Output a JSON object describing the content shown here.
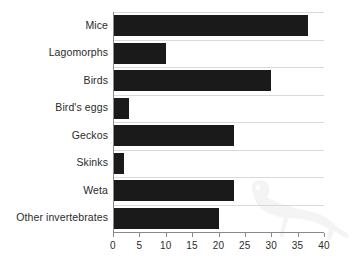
{
  "chart_data": {
    "type": "bar",
    "orientation": "horizontal",
    "title": "",
    "subtitle": "",
    "xlabel": "",
    "ylabel": "",
    "categories": [
      "Mice",
      "Lagomorphs",
      "Birds",
      "Bird's eggs",
      "Geckos",
      "Skinks",
      "Weta",
      "Other invertebrates"
    ],
    "values": [
      37,
      10,
      30,
      3,
      23,
      2,
      23,
      20
    ],
    "series": [
      {
        "name": "",
        "values": [
          37,
          10,
          30,
          3,
          23,
          2,
          23,
          20
        ]
      }
    ],
    "xlim": [
      0,
      40
    ],
    "xticks": [
      0,
      5,
      10,
      15,
      20,
      25,
      30,
      35,
      40
    ],
    "xtick_labels": [
      "0",
      "5",
      "10",
      "15",
      "20",
      "25",
      "30",
      "35",
      "40"
    ],
    "grid": "horizontal",
    "legend": "none",
    "bar_color": "#1a1a1a",
    "gridline_color": "#d9d9d9",
    "axis_color": "#8a8a8a",
    "text_color": "#2b2b2b",
    "annotations": [
      {
        "name": "stoat-silhouette-watermark",
        "kind": "decorative-image",
        "description": "faint stoat/weasel silhouette"
      }
    ]
  }
}
